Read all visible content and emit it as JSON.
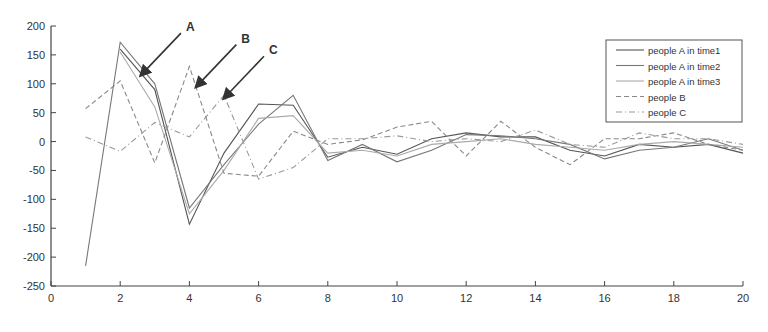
{
  "chart_data": {
    "type": "line",
    "title": "",
    "xlabel": "",
    "ylabel": "",
    "xlim": [
      0,
      20
    ],
    "ylim": [
      -250,
      200
    ],
    "xticks": [
      0,
      2,
      4,
      6,
      8,
      10,
      12,
      14,
      16,
      18,
      20
    ],
    "yticks": [
      200,
      150,
      100,
      50,
      0,
      -50,
      -100,
      -150,
      -200,
      -250
    ],
    "grid": false,
    "legend_position": "upper right",
    "x": [
      1,
      2,
      3,
      4,
      5,
      6,
      7,
      8,
      9,
      10,
      11,
      12,
      13,
      14,
      15,
      16,
      17,
      18,
      19,
      20
    ],
    "series": [
      {
        "name": "people A in time1",
        "style": "solid",
        "color": "#555555",
        "values": [
          null,
          160,
          90,
          -143,
          -20,
          65,
          63,
          -27,
          -10,
          -22,
          5,
          15,
          8,
          8,
          -15,
          -25,
          -5,
          -10,
          -5,
          -20
        ]
      },
      {
        "name": "people A in time2",
        "style": "solid",
        "color": "#777777",
        "values": [
          -215,
          172,
          100,
          -115,
          -40,
          30,
          80,
          -33,
          -5,
          -35,
          -15,
          12,
          10,
          5,
          -5,
          -30,
          -15,
          -10,
          5,
          -15
        ]
      },
      {
        "name": "people A in time3",
        "style": "solid",
        "color": "#aaaaaa",
        "values": [
          null,
          155,
          60,
          -125,
          -50,
          40,
          45,
          -20,
          -15,
          -25,
          -5,
          0,
          5,
          -5,
          -10,
          -15,
          -5,
          0,
          -5,
          -10
        ]
      },
      {
        "name": "people B",
        "style": "dashed",
        "color": "#888888",
        "values": [
          57,
          105,
          -37,
          130,
          -55,
          -60,
          18,
          -5,
          3,
          25,
          35,
          -25,
          35,
          -10,
          -40,
          5,
          5,
          15,
          -5,
          -15
        ]
      },
      {
        "name": "people C",
        "style": "dashdot",
        "color": "#999999",
        "values": [
          8,
          -17,
          33,
          8,
          80,
          -65,
          -45,
          5,
          5,
          10,
          0,
          5,
          0,
          20,
          -5,
          -10,
          15,
          5,
          5,
          -5
        ]
      }
    ],
    "annotations": [
      {
        "text": "A",
        "x": 2.6,
        "y": 115
      },
      {
        "text": "B",
        "x": 4.2,
        "y": 95
      },
      {
        "text": "C",
        "x": 5.0,
        "y": 75
      }
    ]
  }
}
